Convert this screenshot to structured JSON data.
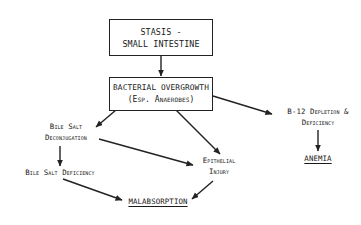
{
  "diagram": {
    "nodes": {
      "stasis": {
        "lines": [
          "STASIS -",
          "SMALL INTESTINE"
        ],
        "boxed": true
      },
      "overgrowth": {
        "lines": [
          "BACTERIAL OVERGROWTH",
          "(Esp. Anaerobes)"
        ],
        "boxed": true
      },
      "deconjugation": {
        "lines": [
          "Bile Salt",
          "Deconjugation"
        ]
      },
      "b12": {
        "lines": [
          "B-12 Depletion &",
          "Deficiency"
        ]
      },
      "bile_deficiency": {
        "lines": [
          "Bile Salt Deficiency"
        ]
      },
      "epithelial": {
        "lines": [
          "Epithelial",
          "Injury"
        ]
      },
      "anemia": {
        "lines": [
          "ANEMIA"
        ],
        "underlined": true
      },
      "malabsorption": {
        "lines": [
          "MALABSORPTION"
        ],
        "underlined": true
      }
    },
    "edges": [
      {
        "from": "stasis",
        "to": "overgrowth"
      },
      {
        "from": "overgrowth",
        "to": "deconjugation"
      },
      {
        "from": "overgrowth",
        "to": "epithelial"
      },
      {
        "from": "overgrowth",
        "to": "b12"
      },
      {
        "from": "deconjugation",
        "to": "bile_deficiency"
      },
      {
        "from": "deconjugation",
        "to": "epithelial"
      },
      {
        "from": "b12",
        "to": "anemia"
      },
      {
        "from": "bile_deficiency",
        "to": "malabsorption"
      },
      {
        "from": "epithelial",
        "to": "malabsorption"
      }
    ],
    "colors": {
      "stroke": "#222222",
      "background": "#ffffff"
    }
  }
}
